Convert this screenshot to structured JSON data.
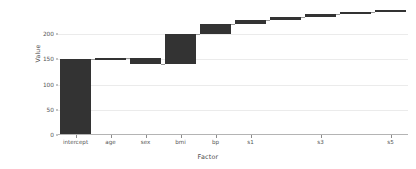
{
  "chart_data": {
    "type": "bar",
    "subtype": "waterfall",
    "title": "",
    "xlabel": "Factor",
    "ylabel": "Value",
    "categories": [
      "intercept",
      "age",
      "sex",
      "bmi",
      "bp",
      "s1",
      "s2",
      "s3",
      "s4",
      "s5"
    ],
    "visible_tick_labels": [
      "intercept",
      "age",
      "sex",
      "bmi",
      "bp",
      "s1",
      "s3",
      "s5"
    ],
    "values": [
      151.0,
      0.8,
      -11.5,
      59.5,
      20.5,
      8.0,
      5.5,
      6.5,
      4.0,
      3.5
    ],
    "cumulative": [
      151.0,
      151.8,
      140.3,
      199.8,
      220.3,
      228.3,
      233.8,
      240.3,
      244.3,
      247.8
    ],
    "bar_starts": [
      0,
      151.0,
      151.8,
      140.3,
      199.8,
      220.3,
      228.3,
      233.8,
      240.3,
      244.3
    ],
    "bar_ends": [
      151.0,
      151.8,
      140.3,
      199.8,
      220.3,
      228.3,
      233.8,
      240.3,
      244.3,
      247.8
    ],
    "ylim": [
      0,
      252
    ],
    "xlim": [
      0,
      10
    ],
    "yticks": [
      0,
      50,
      100,
      150,
      200
    ],
    "ytick_labels": [
      "0",
      "50",
      "100",
      "150",
      "200"
    ],
    "grid": true,
    "grid_axis": "y",
    "legend": false,
    "bar_color": "#333333",
    "grid_color": "#ebebeb",
    "axis_color": "#b4b4b4",
    "background": "#ffffff"
  }
}
